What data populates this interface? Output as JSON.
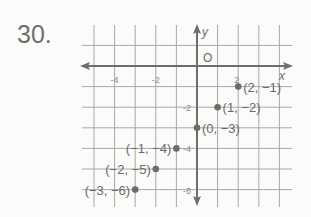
{
  "problem": {
    "number": "30."
  },
  "colors": {
    "grid": "#a8a8a8",
    "axis": "#6e6e6e",
    "point": "#6c6c6c",
    "text": "#6a6a6a"
  },
  "chart_data": {
    "type": "scatter",
    "title": "",
    "xlabel": "x",
    "ylabel": "y",
    "origin_label": "O",
    "xlim": [
      -5,
      4
    ],
    "ylim": [
      -6.8,
      1.5
    ],
    "grid": true,
    "x_tick_labels": [
      {
        "value": -4,
        "label": "-4"
      },
      {
        "value": -2,
        "label": "-2"
      },
      {
        "value": 2,
        "label": "2"
      }
    ],
    "y_tick_labels": [
      {
        "value": -2,
        "label": "-2"
      },
      {
        "value": -4,
        "label": "-4"
      },
      {
        "value": -6,
        "label": "-6"
      }
    ],
    "points": [
      {
        "x": 2,
        "y": -1,
        "label": "(2, −1)"
      },
      {
        "x": 1,
        "y": -2,
        "label": "(1, −2)"
      },
      {
        "x": 0,
        "y": -3,
        "label": "(0, −3)"
      },
      {
        "x": -1,
        "y": -4,
        "label": "(−1, −4)"
      },
      {
        "x": -2,
        "y": -5,
        "label": "(−2, −5)"
      },
      {
        "x": -3,
        "y": -6,
        "label": "(−3, −6)"
      }
    ]
  }
}
